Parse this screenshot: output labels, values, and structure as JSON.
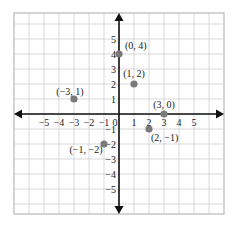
{
  "chart_data": {
    "type": "scatter",
    "title": "",
    "xlabel": "",
    "ylabel": "",
    "xlim": [
      -7,
      7
    ],
    "ylim": [
      -6.7,
      6.7
    ],
    "grid": true,
    "x_ticks": [
      "-5",
      "-4",
      "-3",
      "-2",
      "-1",
      "0",
      "1",
      "2",
      "3",
      "4",
      "5"
    ],
    "y_ticks": [
      "5",
      "4",
      "3",
      "2",
      "1",
      "-1",
      "-2",
      "-3",
      "-4",
      "-5"
    ],
    "points": [
      {
        "x": 0,
        "y": 4,
        "label": "(0, 4)"
      },
      {
        "x": 1,
        "y": 2,
        "label": "(1, 2)"
      },
      {
        "x": -3,
        "y": 1,
        "label": "(−3, 1)"
      },
      {
        "x": 3,
        "y": 0,
        "label": "(3, 0)"
      },
      {
        "x": 2,
        "y": -1,
        "label": "(2, −1)"
      },
      {
        "x": -1,
        "y": -2,
        "label": "(−1, −2)"
      }
    ],
    "colors": {
      "point": "#7a7a7a",
      "grid": "#cfcfcf",
      "border": "#b8b8b8",
      "axis": "#111111"
    }
  }
}
